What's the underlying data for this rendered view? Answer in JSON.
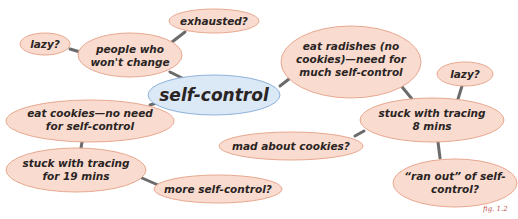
{
  "diagram": {
    "type": "mind-map",
    "colors": {
      "node_fill": "#f9dccf",
      "node_stroke": "#e8a890",
      "center_fill": "#dbe8f6",
      "center_stroke": "#8fb3dc",
      "edge": "#6b6b6b",
      "text": "#2a2424",
      "caption": "#c0504d"
    },
    "center": {
      "id": "self-control",
      "label": "self-control"
    },
    "nodes": [
      {
        "id": "people",
        "lines": [
          "people who",
          "won't change"
        ]
      },
      {
        "id": "exhausted",
        "lines": [
          "exhausted?"
        ]
      },
      {
        "id": "lazy-left",
        "lines": [
          "lazy?"
        ]
      },
      {
        "id": "radishes",
        "lines": [
          "eat radishes (no",
          "cookies)—need for",
          "much self-control"
        ]
      },
      {
        "id": "lazy-right",
        "lines": [
          "lazy?"
        ]
      },
      {
        "id": "tracing-8",
        "lines": [
          "stuck with tracing",
          "8 mins"
        ]
      },
      {
        "id": "mad",
        "lines": [
          "mad about cookies?"
        ]
      },
      {
        "id": "ran-out",
        "lines": [
          "“ran out” of self-",
          "control?"
        ]
      },
      {
        "id": "cookies",
        "lines": [
          "eat cookies—no need",
          "for self-control"
        ]
      },
      {
        "id": "tracing-19",
        "lines": [
          "stuck with tracing",
          "for 19 mins"
        ]
      },
      {
        "id": "more",
        "lines": [
          "more self-control?"
        ]
      }
    ],
    "edges": [
      [
        "self-control",
        "people"
      ],
      [
        "people",
        "exhausted"
      ],
      [
        "people",
        "lazy-left"
      ],
      [
        "self-control",
        "radishes"
      ],
      [
        "radishes",
        "tracing-8"
      ],
      [
        "tracing-8",
        "lazy-right"
      ],
      [
        "tracing-8",
        "mad"
      ],
      [
        "tracing-8",
        "ran-out"
      ],
      [
        "self-control",
        "cookies"
      ],
      [
        "cookies",
        "tracing-19"
      ],
      [
        "tracing-19",
        "more"
      ]
    ],
    "caption": "fig. 1.2"
  }
}
